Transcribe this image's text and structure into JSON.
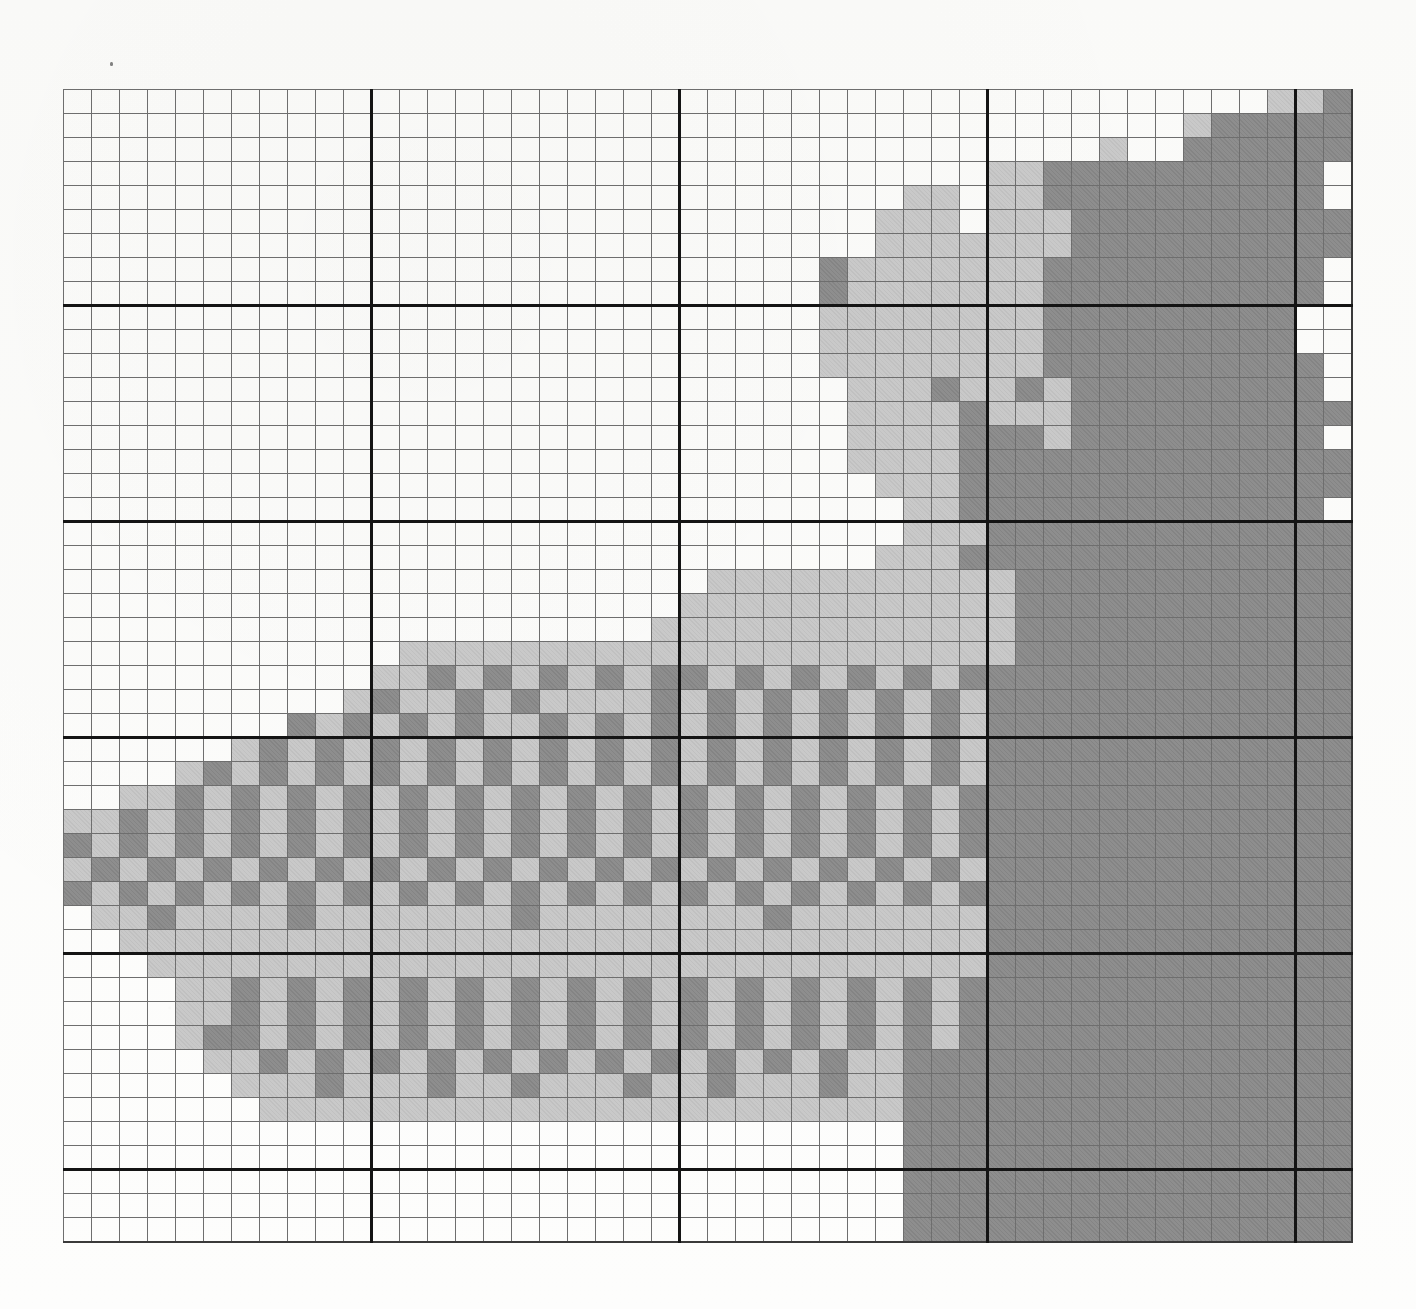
{
  "document": {
    "type": "needlework-chart",
    "title": "Hand-coloured counted cross-stitch / needlepoint chart",
    "medium": "graph paper with pencil shading",
    "grid": {
      "columns": 46,
      "rows": 48,
      "cell_width_px": 28,
      "cell_height_px": 24,
      "major_line_every_columns": 11,
      "major_line_every_rows": 9,
      "thin_line_color": "#6e6e6e",
      "thick_line_color": "#141414",
      "origin_x_px": 63,
      "origin_y_px": 89
    },
    "legend": [
      {
        "key": "w",
        "label": "empty / background",
        "color": "#ffffff"
      },
      {
        "key": "l",
        "label": "light shading",
        "color": "#c9c9c9"
      },
      {
        "key": "d",
        "label": "dark shading",
        "color": "#8e8e8e"
      }
    ]
  },
  "chart_data": {
    "type": "heatmap",
    "xlabel": "",
    "ylabel": "",
    "categories": [],
    "value_map": {
      "w": 0,
      "l": 1,
      "d": 2
    },
    "colors": {
      "0": "#ffffff",
      "1": "#c9c9c9",
      "2": "#8e8e8e"
    },
    "ncols": 46,
    "nrows": 48,
    "cells": [
      "wwwwwwwwwwwwwwwwwwwwwwwwwwwwwwwwwwwwwwwwwwwlld",
      "wwwwwwwwwwwwwwwwwwwwwwwwwwwwwwwwwwwwwwwwlddddd",
      "wwwwwwwwwwwwwwwwwwwwwwwwwwwwwwwwwwwwwlwwdddddd",
      "wwwwwwwwwwwwwwwwwwwwwwwwwwwwwwwwwlldddddddddd",
      "wwwwwwwwwwwwwwwwwwwwwwwwwwwwwwllwlldddddddddd",
      "wwwwwwwwwwwwwwwwwwwwwwwwwwwwwlllwllldddddddddd",
      "wwwwwwwwwwwwwwwwwwwwwwwwwwwwwllllllldddddddddd",
      "wwwwwwwwwwwwwwwwwwwwwwwwwwwdllllllldddddddddd",
      "wwwwwwwwwwwwwwwwwwwwwwwwwwwdllllllldddddddddd",
      "wwwwwwwwwwwwwwwwwwwwwwwwwwwllllllllddddddddd",
      "wwwwwwwwwwwwwwwwwwwwwwwwwwwllllllllddddddddd",
      "wwwwwwwwwwwwwwwwwwwwwwwwwwwlllllllldddddddddd",
      "wwwwwwwwwwwwwwwwwwwwwwwwwwwwllldlldlddddddddd",
      "wwwwwwwwwwwwwwwwwwwwwwwwwwwwlllldllldddddddddd",
      "wwwwwwwwwwwwwwwwwwwwwwwwwwwwlllldddlddddddddd",
      "wwwwwwwwwwwwwwwwwwwwwwwwwwwwlllldddddddddddddd",
      "wwwwwwwwwwwwwwwwwwwwwwwwwwwwwllldddddddddddddd",
      "wwwwwwwwwwwwwwwwwwwwwwwwwwwwwwllddddddddddddd",
      "wwwwwwwwwwwwwwwwwwwwwwwwwwwwwwlllddddddddddddd",
      "wwwwwwwwwwwwwwwwwwwwwwwwwwwwwllldddddddddddddd",
      "wwwwwwwwwwwwwwwwwwwwwwwllllllllllldddddddddddd",
      "wwwwwwwwwwwwwwwwwwwwwwlllllllllllldddddddddddd",
      "wwwwwwwwwwwwwwwwwwwwwlllllllllllllddddddddddddd",
      "wwwwwwwwwwwwllllllllllllllllllllllddddddddddddd",
      "wwwwwwwwwwwlldldldldlddldldldldldddddddddddddd",
      "wwwwwwwwwwldlldldlllldldldldldldldddddddddddddd",
      "wwwwwwwwdldldldlldldldldldldldldldddddddddddddd",
      "wwwwwwldldldldldldldldldldldldldldddddddddddddd",
      "wwwwldldldldldldldldldldldldldldlddddddddddddddd",
      "wwlldldldldldldldldldldldldldldldddddddddddddddd",
      "lldldldldldldldldldldldldldldldldddddddddddddddd",
      "dldldldldldldldldldldldldldldldldddddddddddddddd",
      "ldldldldldldldldldldldldldldldldlddddddddddddddd",
      "dldldldldldldldldldldldldldldldlddddddddddddddd",
      "wlldlllldllllllldlllllllldlllllllddddddddddddddd",
      "wwllllllllllllllllllllllllllllllldddddddddddddd",
      "wwwllllllllllllllllllllllllllllllddddddddddddddd",
      "wwwwlldldldldldldldldldldldldldldddddddddddddddd",
      "wwwwlldldldldldldldldldldldldldldddddddddddddddd",
      "wwwwlddldldldldldldldldldldldldlddddddddddddddd",
      "wwwwwlldldldldldldldldldldldlldddddddddddddddddd",
      "wwwwwwllldllldlldllldlldllldllddddddddddddddddd",
      "wwwwwwwllllllllllllllllllllllldddddddddddddddddd",
      "wwwwwwwwwwwwwwwwwwwwwwwwwwwwwwddddddddddddddddd",
      "wwwwwwwwwwwwwwwwwwwwwwwwwwwwwwddddddddddddddddd",
      "wwwwwwwwwwwwwwwwwwwwwwwwwwwwwwddddddddddddddddd",
      "wwwwwwwwwwwwwwwwwwwwwwwwwwwwwwddddddddddddddddd",
      "wwwwwwwwwwwwwwwwwwwwwwwwwwwwwwddddddddddddddddd"
    ]
  }
}
